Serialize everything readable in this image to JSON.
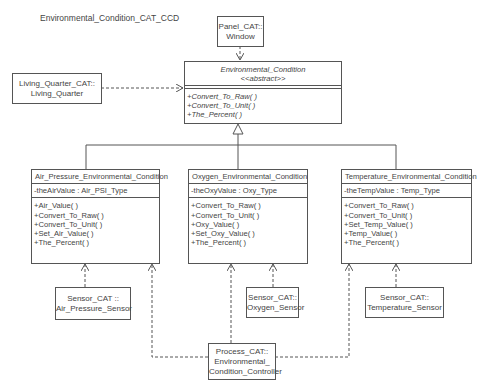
{
  "diagram": {
    "title": "Environmental_Condition_CAT_CCD",
    "panel_window": {
      "line1": "Panel_CAT::",
      "line2": "Window"
    },
    "living_quarter": {
      "line1": "Living_Quarter_CAT::",
      "line2": "Living_Quarter"
    },
    "abstract_class": {
      "name": "Environmental_Condition",
      "stereotype": "<<abstract>>",
      "operations": [
        "+Convert_To_Raw( )",
        "+Convert_To_Unit( )",
        "+The_Percent( )"
      ]
    },
    "classes": [
      {
        "name": "Air_Pressure_Environmental_Condition",
        "attribute": "-theAirValue : Air_PSI_Type",
        "operations": [
          "+Air_Value( )",
          "+Convert_To_Raw( )",
          "+Convert_To_Unit( )",
          "+Set_Air_Value( )",
          "+The_Percent( )"
        ]
      },
      {
        "name": "Oxygen_Environmental_Condition",
        "attribute": "-theOxyValue : Oxy_Type",
        "operations": [
          "+Convert_To_Raw( )",
          "+Convert_To_Unit( )",
          "+Oxy_Value( )",
          "+Set_Oxy_Value( )",
          "+The_Percent( )"
        ]
      },
      {
        "name": "Temperature_Environmental_Condition",
        "attribute": "-theTempValue : Temp_Type",
        "operations": [
          "+Convert_To_Raw( )",
          "+Convert_To_Unit( )",
          "+Set_Temp_Value( )",
          "+Temp_Value( )",
          "+The_Percent( )"
        ]
      }
    ],
    "sensors": [
      {
        "line1": "Sensor_CAT ::",
        "line2": "Air_Pressure_Sensor"
      },
      {
        "line1": "Sensor_CAT::",
        "line2": "Oxygen_Sensor"
      },
      {
        "line1": "Sensor_CAT::",
        "line2": "Temperature_Sensor"
      }
    ],
    "controller": {
      "line1": "Process_CAT::",
      "line2": "Environmental_",
      "line3": "Condition_Controller"
    },
    "colors": {
      "line": "#555555",
      "text": "#444444",
      "background": "#ffffff"
    }
  }
}
